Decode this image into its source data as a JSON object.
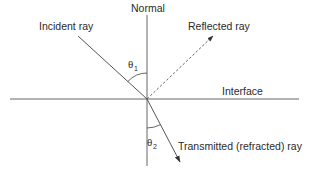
{
  "diagram": {
    "labels": {
      "normal": "Normal",
      "incident": "Incident ray",
      "reflected": "Reflected ray",
      "interface": "Interface",
      "transmitted": "Transmitted (refracted) ray",
      "theta1_symbol": "θ",
      "theta1_sub": "1",
      "theta2_symbol": "θ",
      "theta2_sub": "2"
    },
    "colors": {
      "line": "#555555",
      "text": "#2a2a2a",
      "background": "#ffffff"
    }
  }
}
